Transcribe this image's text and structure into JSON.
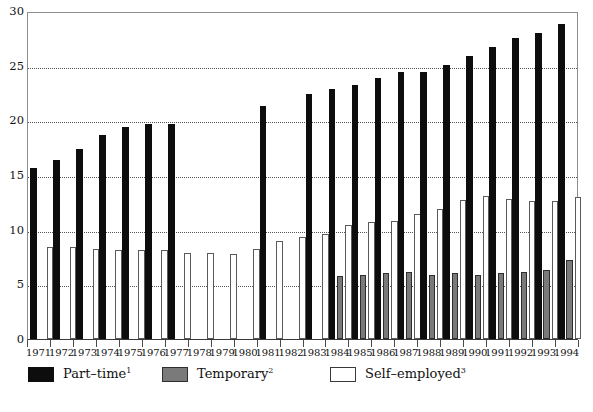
{
  "chart_data": {
    "type": "bar",
    "title": "",
    "subtitle": "",
    "xlabel": "",
    "ylabel": "",
    "ylim": [
      0,
      30
    ],
    "yticks": [
      0,
      5,
      10,
      15,
      20,
      25,
      30
    ],
    "grid": true,
    "legend_position": "bottom",
    "categories": [
      "1971",
      "1972",
      "1973",
      "1974",
      "1975",
      "1976",
      "1977",
      "1978",
      "1979",
      "1980",
      "1981",
      "1982",
      "1983",
      "1984",
      "1985",
      "1986",
      "1987",
      "1988",
      "1989",
      "1990",
      "1991",
      "1992",
      "1993",
      "1994"
    ],
    "series": [
      {
        "name": "Part-time",
        "footnote": "1",
        "color": "#0d0d0d",
        "values": [
          15.6,
          16.4,
          17.4,
          18.7,
          19.4,
          19.7,
          19.7,
          null,
          null,
          null,
          21.3,
          null,
          22.4,
          22.9,
          23.2,
          23.9,
          24.4,
          24.4,
          25.1,
          25.9,
          26.7,
          27.5,
          28.0,
          28.8
        ]
      },
      {
        "name": "Temporary",
        "footnote": "2",
        "color": "#7a7a7a",
        "values": [
          null,
          null,
          null,
          null,
          null,
          null,
          null,
          null,
          null,
          null,
          null,
          null,
          null,
          5.8,
          5.9,
          6.0,
          6.1,
          5.9,
          6.0,
          5.9,
          6.0,
          6.1,
          6.3,
          7.2
        ]
      },
      {
        "name": "Self-employed",
        "footnote": "3",
        "color": "#ffffff",
        "values": [
          8.4,
          8.4,
          8.2,
          8.1,
          8.1,
          8.1,
          7.9,
          7.9,
          7.8,
          8.2,
          9.0,
          9.3,
          9.6,
          10.4,
          10.7,
          10.8,
          11.4,
          11.9,
          12.7,
          13.1,
          12.8,
          12.6,
          12.6,
          13.0
        ]
      }
    ]
  },
  "axis": {
    "y_tick_labels": [
      "0",
      "5",
      "10",
      "15",
      "20",
      "25",
      "30"
    ],
    "x_tick_labels": [
      "1971",
      "1972",
      "1973",
      "1974",
      "1975",
      "1976",
      "1977",
      "1978",
      "1979",
      "1980",
      "1981",
      "1982",
      "1983",
      "1984",
      "1985",
      "1986",
      "1987",
      "1988",
      "1989",
      "1990",
      "1991",
      "1992",
      "1993",
      "1994"
    ]
  },
  "legend": {
    "items": [
      {
        "label": "Part–time",
        "sup": "1",
        "swatch": "black-filled-swatch"
      },
      {
        "label": "Temporary",
        "sup": "2",
        "swatch": "gray-filled-swatch"
      },
      {
        "label": "Self–employed",
        "sup": "3",
        "swatch": "white-outlined-swatch"
      }
    ]
  }
}
